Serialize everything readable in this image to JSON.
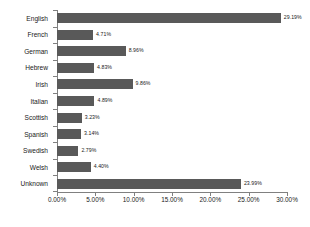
{
  "chart_data": {
    "type": "bar",
    "orientation": "horizontal",
    "title": "",
    "xlabel": "",
    "ylabel": "",
    "xlim": [
      0,
      30
    ],
    "grid": false,
    "legend": false,
    "categories": [
      "English",
      "French",
      "German",
      "Hebrew",
      "Irish",
      "Italian",
      "Scottish",
      "Spanish",
      "Swedish",
      "Welsh",
      "Unknown"
    ],
    "values": [
      29.19,
      4.71,
      8.96,
      4.83,
      9.86,
      4.89,
      3.23,
      3.14,
      2.79,
      4.4,
      23.99
    ],
    "value_labels": [
      "29.19%",
      "4.71%",
      "8.96%",
      "4.83%",
      "9.86%",
      "4.89%",
      "3.23%",
      "3.14%",
      "2.79%",
      "4.40%",
      "23.99%"
    ],
    "x_ticks": [
      0,
      5,
      10,
      15,
      20,
      25,
      30
    ],
    "x_tick_labels": [
      "0.00%",
      "5.00%",
      "10.00%",
      "15.00%",
      "20.00%",
      "25.00%",
      "30.00%"
    ],
    "bar_color": "#595959",
    "axis_color": "#808080",
    "text_color": "#1a1a1a",
    "background_color": "#ffffff"
  }
}
